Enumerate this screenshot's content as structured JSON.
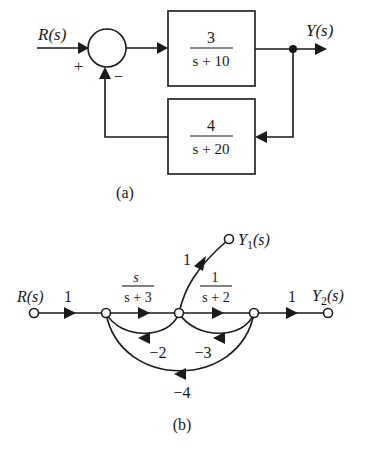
{
  "part_a": {
    "input_label": "R(s)",
    "output_label": "Y(s)",
    "sum_plus": "+",
    "sum_minus": "−",
    "forward_block": {
      "numerator": "3",
      "denominator": "s + 10"
    },
    "feedback_block": {
      "numerator": "4",
      "denominator": "s + 20"
    },
    "caption": "(a)"
  },
  "part_b": {
    "input_label": "R(s)",
    "output1_label_base": "Y",
    "output1_label_sub": "1",
    "output1_label_arg": "(s)",
    "output2_label_base": "Y",
    "output2_label_sub": "2",
    "output2_label_arg": "(s)",
    "branches": {
      "input_gain": "1",
      "g1_num": "s",
      "g1_den": "s + 3",
      "g2_num": "1",
      "g2_den": "s + 2",
      "output2_gain": "1",
      "output1_gain": "1",
      "loop_n2_n1": "−2",
      "loop_n3_n2": "−3",
      "loop_n3_n1": "−4"
    },
    "caption": "(b)"
  },
  "colors": {
    "ink": "#1a1a1a",
    "background": "#ffffff"
  }
}
